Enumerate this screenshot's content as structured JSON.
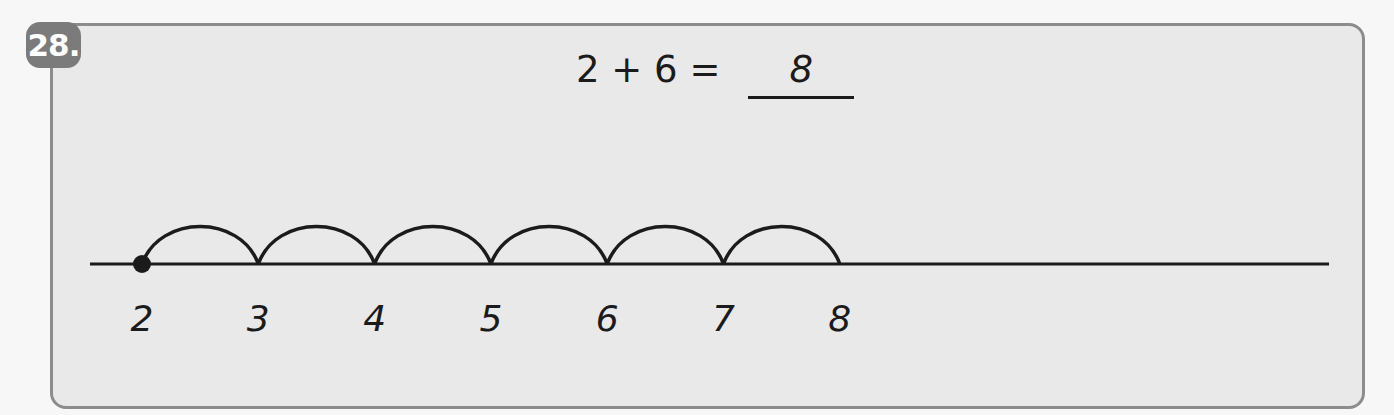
{
  "problem": {
    "number": "28.",
    "equation": {
      "addend1": "2",
      "operator": "+",
      "addend2": "6",
      "equals": "=",
      "answer": "8"
    }
  },
  "number_line": {
    "start": 2,
    "jumps": 6,
    "labels": [
      "2",
      "3",
      "4",
      "5",
      "6",
      "7",
      "8"
    ],
    "start_marker": "filled-dot",
    "colors": {
      "stroke": "#1b1b1b",
      "panel": "#e9e9e9",
      "badge": "#7b7b7b"
    }
  }
}
